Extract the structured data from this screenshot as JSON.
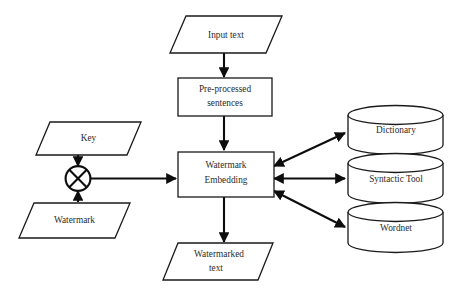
{
  "diagram": {
    "type": "flowchart",
    "background_color": "#ffffff",
    "line_color": "#0d0d0d",
    "text_color": "#2b2b2b",
    "nodes": {
      "input_text": {
        "label": "Input text",
        "shape": "parallelogram"
      },
      "preprocessed": {
        "label_line1": "Pre-processed",
        "label_line2": "sentences",
        "shape": "rectangle"
      },
      "key": {
        "label": "Key",
        "shape": "parallelogram"
      },
      "watermark": {
        "label": "Watermark",
        "shape": "parallelogram"
      },
      "combine_operator": {
        "label": "⊗",
        "shape": "circle-cross"
      },
      "embedding": {
        "label_line1": "Watermark",
        "label_line2": "Embedding",
        "shape": "rectangle"
      },
      "watermarked_text": {
        "label_line1": "Watermarked",
        "label_line2": "text",
        "shape": "parallelogram"
      },
      "dictionary": {
        "label": "Dictionary",
        "shape": "cylinder"
      },
      "syntactic_tool": {
        "label": "Syntactic Tool",
        "shape": "cylinder"
      },
      "wordnet": {
        "label": "Wordnet",
        "shape": "cylinder"
      }
    },
    "edges": [
      {
        "from": "input_text",
        "to": "preprocessed",
        "direction": "one-way"
      },
      {
        "from": "preprocessed",
        "to": "embedding",
        "direction": "one-way"
      },
      {
        "from": "key",
        "to": "combine_operator",
        "direction": "one-way"
      },
      {
        "from": "watermark",
        "to": "combine_operator",
        "direction": "one-way"
      },
      {
        "from": "combine_operator",
        "to": "embedding",
        "direction": "one-way"
      },
      {
        "from": "embedding",
        "to": "watermarked_text",
        "direction": "one-way"
      },
      {
        "from": "embedding",
        "to": "dictionary",
        "direction": "bidirectional"
      },
      {
        "from": "embedding",
        "to": "syntactic_tool",
        "direction": "bidirectional"
      },
      {
        "from": "embedding",
        "to": "wordnet",
        "direction": "bidirectional"
      }
    ]
  }
}
